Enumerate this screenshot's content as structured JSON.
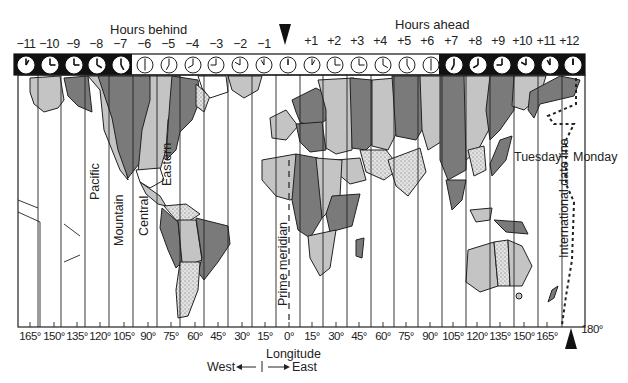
{
  "header": {
    "hours_behind_label": "Hours behind",
    "hours_ahead_label": "Hours ahead"
  },
  "time_zones": {
    "offsets": [
      "−11",
      "−10",
      "−9",
      "−8",
      "−7",
      "−6",
      "−5",
      "−4",
      "−3",
      "−2",
      "−1",
      "",
      "+1",
      "+2",
      "+3",
      "+4",
      "+5",
      "+6",
      "+7",
      "+8",
      "+9",
      "+10",
      "+11",
      "+12"
    ],
    "night_zones_dark": [
      0,
      1,
      2,
      3,
      4,
      18,
      19,
      20,
      21,
      22,
      23
    ],
    "clock_hours": [
      1,
      3,
      3,
      4,
      5,
      6,
      7,
      8,
      9,
      10,
      11,
      12,
      1,
      3,
      3,
      4,
      5,
      6,
      7,
      8,
      9,
      10,
      11,
      12
    ]
  },
  "zone_labels": {
    "pacific": "Pacific",
    "mountain": "Mountain",
    "central": "Central",
    "eastern": "Eastern",
    "prime_meridian": "Prime meridian",
    "date_line": "International date line",
    "tuesday": "Tuesday",
    "monday": "Monday"
  },
  "longitude_axis": {
    "title": "Longitude",
    "west_label": "West",
    "east_label": "East",
    "ticks": [
      "165°",
      "150°",
      "135°",
      "120°",
      "105°",
      "90°",
      "75°",
      "60°",
      "45°",
      "30°",
      "15°",
      "0°",
      "15°",
      "30°",
      "45°",
      "60°",
      "75°",
      "90°",
      "105°",
      "120°",
      "135°",
      "150°",
      "165°",
      "180°"
    ]
  },
  "colors": {
    "dark_land": "#7a7a7a",
    "light_land": "#c4c4c4",
    "stippled_land": "#d9d9d9",
    "ocean": "#ffffff",
    "night_band": "#111111",
    "lines": "#222222"
  }
}
